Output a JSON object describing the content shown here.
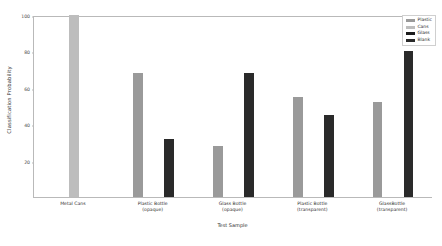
{
  "chart_data": {
    "type": "bar",
    "title": "",
    "xlabel": "Test Sample",
    "ylabel": "Classification Probability",
    "ylim": [
      0,
      100
    ],
    "yticks": [
      20,
      40,
      60,
      80,
      100
    ],
    "grid": false,
    "legend_position": "upper right",
    "categories": [
      "Metal Cans",
      "Plastic Bottle\n(opaque)",
      "Glass Bottle\n(opaque)",
      "Plastic Bottle\n(transparent)",
      "GlassBottle\n(transparent)"
    ],
    "series": [
      {
        "name": "Plastic",
        "color": "#9a9a9a",
        "values": [
          null,
          68,
          28,
          55,
          52
        ]
      },
      {
        "name": "Cans",
        "color": "#bdbdbd",
        "values": [
          100,
          null,
          null,
          null,
          null
        ]
      },
      {
        "name": "Glass",
        "color": "#1c1c1c",
        "values": [
          null,
          null,
          null,
          null,
          null
        ]
      },
      {
        "name": "Blank",
        "color": "#2a2a2a",
        "values": [
          null,
          32,
          68,
          45,
          80
        ]
      }
    ],
    "bars": [
      {
        "group": 0,
        "series": "Cans",
        "value": 100,
        "color": "#bdbdbd",
        "slot": 1
      },
      {
        "group": 1,
        "series": "Plastic",
        "value": 68,
        "color": "#9a9a9a",
        "slot": 0
      },
      {
        "group": 1,
        "series": "Blank",
        "value": 32,
        "color": "#2a2a2a",
        "slot": 2
      },
      {
        "group": 2,
        "series": "Plastic",
        "value": 28,
        "color": "#9a9a9a",
        "slot": 0
      },
      {
        "group": 2,
        "series": "Blank",
        "value": 68,
        "color": "#2a2a2a",
        "slot": 2
      },
      {
        "group": 3,
        "series": "Plastic",
        "value": 55,
        "color": "#9a9a9a",
        "slot": 0
      },
      {
        "group": 3,
        "series": "Blank",
        "value": 45,
        "color": "#2a2a2a",
        "slot": 2
      },
      {
        "group": 4,
        "series": "Plastic",
        "value": 52,
        "color": "#9a9a9a",
        "slot": 0
      },
      {
        "group": 4,
        "series": "Blank",
        "value": 80,
        "color": "#2a2a2a",
        "slot": 2
      }
    ]
  },
  "legend": {
    "items": [
      {
        "label": "Plastic",
        "color": "#9a9a9a"
      },
      {
        "label": "Cans",
        "color": "#bdbdbd"
      },
      {
        "label": "Glass",
        "color": "#1c1c1c"
      },
      {
        "label": "Blank",
        "color": "#2a2a2a"
      }
    ]
  },
  "axis": {
    "y_title": "Classification Probability",
    "x_title": "Test Sample"
  }
}
